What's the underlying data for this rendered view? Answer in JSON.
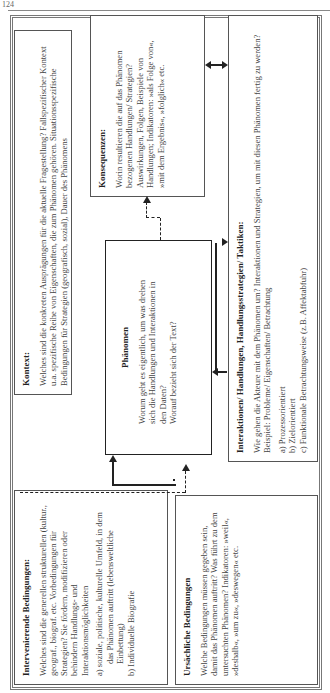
{
  "page": {
    "number": "124"
  },
  "diagram": {
    "kontext": {
      "title": "Kontext:",
      "text": "Welches sind die konkreten Ausprägungen für die aktuelle Fragestellung? Fallspezifischer Kontext u.a. spezifische Reihe von Eigenschaften, die zum Phänomen gehören. Situationsspezifische Bedingungen für Strategien (geografisch, sozial), Dauer des Phänomens"
    },
    "konsequenzen": {
      "title": "Konsequenzen:",
      "text": "Worin resultieren die auf das Phänomen bezogenen Handlungen/ Strategien? Auswirkungen, Folgen, Beispiele von Handlungen; Indikatoren: »als Folge von«, »mit dem Ergebnis«, »folglich« etc."
    },
    "phaenomen": {
      "title": "Phänomen",
      "text1": "Worum geht es eigentlich, um was drehen sich die Handlungen und Interaktionen in den Daten?",
      "text2": "Worauf bezieht sich der Text?"
    },
    "interaktionen": {
      "title": "Interaktionen/ Handlungen, Handlungsstrategien/ Taktiken:",
      "text": "Wie gehen die Akteure mit dem Phänomen um? Interaktionen und Strategien, um mit diesen Phänomen fertig zu werden? Beispiel: Probleme/ Eigenschaften/ Betrachtung",
      "items": [
        "a)  Prozessorientiert",
        "b)  Zielorientiert",
        "c)  Funktionale Betrachtungsweise (z.B. Affektabfuhr)"
      ]
    },
    "intervenierende": {
      "title": "Intervenierende Bedingungen:",
      "text": "Welches sind die generellen strukturellen (kultur., geograf., biograf. etc. Vorbedingungen für Strategien? Sie fördern, modifizieren oder behindern Handlungs- und Interaktionsmöglichkeiten",
      "items": [
        "a)  soziale, politische, kulturelle Umfeld, in dem das Phänomen auftritt (lebensweltliche Einbettung)",
        "b)  Individuelle Biografie"
      ]
    },
    "ursaechliche": {
      "title": "Ursächliche Bedingungen",
      "text": "Welche Bedingungen müssen gegeben sein, damit das Phänomen auftritt? Was führt zu dem untersuchten Phänomen? Indikatoren: »weil«, »deshalb«, »um zu«, »deswegen« etc."
    }
  }
}
